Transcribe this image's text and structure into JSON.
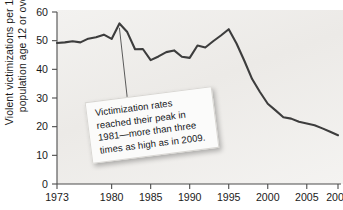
{
  "chart_data": {
    "type": "line",
    "title": "",
    "xlabel": "",
    "ylabel_line1": "Violent victimizations per 1,000",
    "ylabel_line2": "population age 12 or over",
    "xlim": [
      1973,
      2009
    ],
    "ylim": [
      0,
      60
    ],
    "grid": false,
    "legend": "none",
    "line_color": "#3d3d3d",
    "plot_background_color": "#f0efec",
    "xticks": [
      1973,
      1980,
      1985,
      1990,
      1995,
      2000,
      2005,
      2009
    ],
    "xtick_labels": [
      "1973",
      "1980",
      "1985",
      "1990",
      "1995",
      "2000",
      "2005",
      "2009"
    ],
    "yticks": [
      0,
      10,
      20,
      30,
      40,
      50,
      60
    ],
    "ytick_labels": [
      "0",
      "10",
      "20",
      "30",
      "40",
      "50",
      "60"
    ],
    "x": [
      1973,
      1974,
      1975,
      1976,
      1977,
      1978,
      1979,
      1980,
      1981,
      1982,
      1983,
      1984,
      1985,
      1986,
      1987,
      1988,
      1989,
      1990,
      1991,
      1992,
      1993,
      1994,
      1995,
      1996,
      1997,
      1998,
      1999,
      2000,
      2001,
      2002,
      2003,
      2004,
      2005,
      2006,
      2007,
      2008,
      2009
    ],
    "values": [
      49.2,
      49.4,
      49.8,
      49.4,
      50.7,
      51.2,
      52.1,
      50.6,
      56.0,
      53.0,
      47.0,
      47.1,
      43.2,
      44.5,
      46.0,
      46.6,
      44.4,
      44.0,
      48.3,
      47.6,
      49.8,
      51.8,
      54.0,
      49.0,
      43.0,
      36.6,
      32.1,
      28.0,
      25.7,
      23.3,
      22.8,
      21.7,
      21.1,
      20.5,
      19.4,
      18.2,
      17.0
    ],
    "annotation": {
      "line1": "Victimization rates",
      "line2": "reached their peak in",
      "line3": "1981—more than three",
      "line4": "times as high as in 2009.",
      "points_to_year": 1981,
      "points_to_value": 54.5
    }
  }
}
